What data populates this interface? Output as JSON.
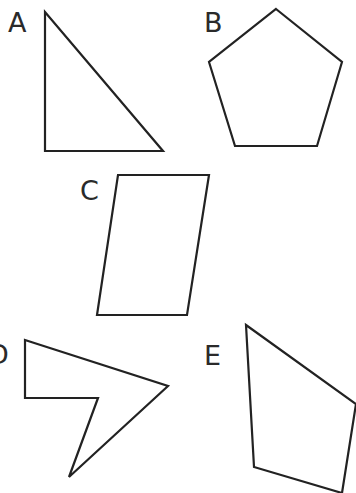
{
  "diagram": {
    "stroke_color": "#222222",
    "background": "#ffffff",
    "shapes": [
      {
        "label": "A",
        "type": "right-triangle",
        "label_pos": [
          8,
          32
        ],
        "points": "45,12 45,151 163,151"
      },
      {
        "label": "B",
        "type": "regular-pentagon",
        "label_pos": [
          204,
          32
        ],
        "points": "276,9 342,62 317,146 235,146 209,62"
      },
      {
        "label": "C",
        "type": "parallelogram",
        "label_pos": [
          80,
          200
        ],
        "points": "118,175 209,175 187,315 97,315"
      },
      {
        "label": "D",
        "type": "concave-pentagon",
        "label_pos": [
          -12,
          364
        ],
        "points": "25,340 168,386 69,477 98,398 25,398"
      },
      {
        "label": "E",
        "type": "irregular-quadrilateral",
        "label_pos": [
          204,
          365
        ],
        "points": "246,325 356,404 342,493 254,467"
      }
    ]
  }
}
